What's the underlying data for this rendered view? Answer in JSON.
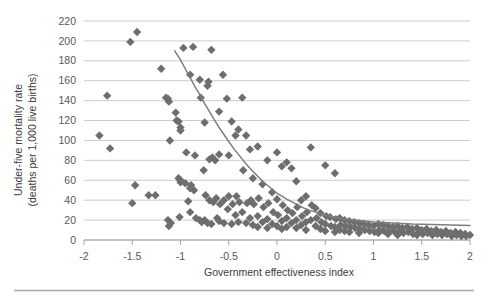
{
  "chart_data": {
    "type": "scatter",
    "title": "",
    "subtitle": "",
    "xlabel": "Government effectiveness index",
    "ylabel": "Under-five mortality rate (deaths per 1,000 live births)",
    "ylabel_line1": "Under-five mortality rate",
    "ylabel_line2": "(deaths per 1,000 live births)",
    "xlim": [
      -2,
      2
    ],
    "ylim": [
      0,
      220
    ],
    "xticks": [
      -2,
      -1.5,
      -1,
      -0.5,
      0,
      0.5,
      1,
      1.5,
      2
    ],
    "xtick_labels": [
      "-2",
      "-1.5",
      "-1",
      "-0.5",
      "0",
      "0.5",
      "1",
      "1.5",
      "2"
    ],
    "yticks": [
      0,
      20,
      40,
      60,
      80,
      100,
      120,
      140,
      160,
      180,
      200,
      220
    ],
    "ytick_labels": [
      "0",
      "20",
      "40",
      "60",
      "80",
      "100",
      "120",
      "140",
      "160",
      "180",
      "200",
      "220"
    ],
    "grid": "horizontal",
    "legend": "none",
    "marker_shape": "diamond",
    "marker_color": "#6d6e70",
    "marker_size": 4.2,
    "trendline": {
      "type": "power-decay",
      "color": "#7d7e80",
      "width": 1.5,
      "points": [
        [
          -1.06,
          190
        ],
        [
          -1.0,
          181
        ],
        [
          -0.95,
          172
        ],
        [
          -0.9,
          163
        ],
        [
          -0.85,
          154
        ],
        [
          -0.8,
          146
        ],
        [
          -0.75,
          137
        ],
        [
          -0.7,
          129
        ],
        [
          -0.65,
          121
        ],
        [
          -0.6,
          113
        ],
        [
          -0.55,
          106
        ],
        [
          -0.5,
          99
        ],
        [
          -0.45,
          92
        ],
        [
          -0.4,
          86
        ],
        [
          -0.35,
          80
        ],
        [
          -0.3,
          74
        ],
        [
          -0.25,
          69
        ],
        [
          -0.2,
          64
        ],
        [
          -0.15,
          59
        ],
        [
          -0.1,
          55
        ],
        [
          -0.05,
          51
        ],
        [
          0.0,
          47
        ],
        [
          0.1,
          41
        ],
        [
          0.2,
          36
        ],
        [
          0.3,
          31
        ],
        [
          0.4,
          28
        ],
        [
          0.5,
          25
        ],
        [
          0.6,
          23
        ],
        [
          0.7,
          21
        ],
        [
          0.8,
          20
        ],
        [
          0.9,
          19
        ],
        [
          1.0,
          18
        ],
        [
          1.2,
          17
        ],
        [
          1.4,
          16
        ],
        [
          1.6,
          15.5
        ],
        [
          1.8,
          15
        ],
        [
          2.0,
          14.5
        ]
      ]
    },
    "points": [
      [
        -1.84,
        105
      ],
      [
        -1.76,
        145
      ],
      [
        -1.73,
        92
      ],
      [
        -1.52,
        199
      ],
      [
        -1.45,
        209
      ],
      [
        -1.47,
        55
      ],
      [
        -1.5,
        37
      ],
      [
        -1.33,
        45
      ],
      [
        -1.26,
        45
      ],
      [
        -1.2,
        172
      ],
      [
        -1.15,
        143
      ],
      [
        -1.13,
        142
      ],
      [
        -1.12,
        139
      ],
      [
        -1.11,
        100
      ],
      [
        -1.13,
        20
      ],
      [
        -1.12,
        14
      ],
      [
        -1.1,
        17
      ],
      [
        -1.05,
        128
      ],
      [
        -1.04,
        120
      ],
      [
        -1.02,
        119
      ],
      [
        -1.0,
        113
      ],
      [
        -1.0,
        110
      ],
      [
        -1.02,
        62
      ],
      [
        -1.0,
        60
      ],
      [
        -1.0,
        58
      ],
      [
        -1.01,
        23
      ],
      [
        -0.97,
        193
      ],
      [
        -0.94,
        88
      ],
      [
        -0.95,
        57
      ],
      [
        -0.9,
        166
      ],
      [
        -0.89,
        55
      ],
      [
        -0.9,
        52
      ],
      [
        -0.92,
        39
      ],
      [
        -0.9,
        28
      ],
      [
        -0.87,
        194
      ],
      [
        -0.85,
        85
      ],
      [
        -0.86,
        50
      ],
      [
        -0.84,
        22
      ],
      [
        -0.8,
        161
      ],
      [
        -0.79,
        143
      ],
      [
        -0.8,
        20
      ],
      [
        -0.78,
        18
      ],
      [
        -0.75,
        118
      ],
      [
        -0.76,
        70
      ],
      [
        -0.74,
        45
      ],
      [
        -0.75,
        20
      ],
      [
        -0.72,
        155
      ],
      [
        -0.71,
        159
      ],
      [
        -0.7,
        81
      ],
      [
        -0.7,
        40
      ],
      [
        -0.72,
        17
      ],
      [
        -0.68,
        191
      ],
      [
        -0.67,
        83
      ],
      [
        -0.66,
        38
      ],
      [
        -0.68,
        16
      ],
      [
        -0.64,
        80
      ],
      [
        -0.63,
        42
      ],
      [
        -0.62,
        22
      ],
      [
        -0.6,
        129
      ],
      [
        -0.6,
        86
      ],
      [
        -0.59,
        36
      ],
      [
        -0.6,
        19
      ],
      [
        -0.56,
        166
      ],
      [
        -0.55,
        40
      ],
      [
        -0.55,
        17
      ],
      [
        -0.52,
        142
      ],
      [
        -0.5,
        85
      ],
      [
        -0.5,
        44
      ],
      [
        -0.51,
        31
      ],
      [
        -0.47,
        119
      ],
      [
        -0.46,
        36
      ],
      [
        -0.47,
        16
      ],
      [
        -0.43,
        105
      ],
      [
        -0.42,
        44
      ],
      [
        -0.43,
        25
      ],
      [
        -0.4,
        111
      ],
      [
        -0.39,
        38
      ],
      [
        -0.4,
        18
      ],
      [
        -0.36,
        143
      ],
      [
        -0.35,
        70
      ],
      [
        -0.36,
        28
      ],
      [
        -0.32,
        105
      ],
      [
        -0.31,
        37
      ],
      [
        -0.32,
        17
      ],
      [
        -0.28,
        91
      ],
      [
        -0.27,
        40
      ],
      [
        -0.28,
        22
      ],
      [
        -0.25,
        62
      ],
      [
        -0.24,
        36
      ],
      [
        -0.25,
        15
      ],
      [
        -0.2,
        94
      ],
      [
        -0.19,
        42
      ],
      [
        -0.2,
        24
      ],
      [
        -0.2,
        13
      ],
      [
        -0.15,
        56
      ],
      [
        -0.14,
        33
      ],
      [
        -0.15,
        18
      ],
      [
        -0.1,
        80
      ],
      [
        -0.09,
        37
      ],
      [
        -0.1,
        21
      ],
      [
        -0.1,
        12
      ],
      [
        -0.05,
        48
      ],
      [
        -0.04,
        28
      ],
      [
        -0.05,
        16
      ],
      [
        0.0,
        88
      ],
      [
        0.0,
        41
      ],
      [
        0.01,
        25
      ],
      [
        0.0,
        14
      ],
      [
        0.05,
        74
      ],
      [
        0.06,
        35
      ],
      [
        0.05,
        19
      ],
      [
        0.05,
        11
      ],
      [
        0.1,
        78
      ],
      [
        0.11,
        30
      ],
      [
        0.1,
        22
      ],
      [
        0.1,
        13
      ],
      [
        0.15,
        72
      ],
      [
        0.16,
        27
      ],
      [
        0.15,
        17
      ],
      [
        0.2,
        59
      ],
      [
        0.21,
        33
      ],
      [
        0.2,
        20
      ],
      [
        0.2,
        12
      ],
      [
        0.25,
        40
      ],
      [
        0.26,
        24
      ],
      [
        0.25,
        15
      ],
      [
        0.3,
        44
      ],
      [
        0.31,
        28
      ],
      [
        0.3,
        18
      ],
      [
        0.3,
        10
      ],
      [
        0.35,
        93
      ],
      [
        0.36,
        35
      ],
      [
        0.35,
        20
      ],
      [
        0.4,
        32
      ],
      [
        0.41,
        22
      ],
      [
        0.4,
        14
      ],
      [
        0.45,
        27
      ],
      [
        0.46,
        18
      ],
      [
        0.45,
        11
      ],
      [
        0.5,
        75
      ],
      [
        0.51,
        24
      ],
      [
        0.5,
        16
      ],
      [
        0.5,
        9
      ],
      [
        0.55,
        23
      ],
      [
        0.56,
        14
      ],
      [
        0.6,
        67
      ],
      [
        0.61,
        21
      ],
      [
        0.6,
        13
      ],
      [
        0.6,
        8
      ],
      [
        0.65,
        22
      ],
      [
        0.66,
        15
      ],
      [
        0.65,
        10
      ],
      [
        0.7,
        20
      ],
      [
        0.71,
        14
      ],
      [
        0.7,
        9
      ],
      [
        0.75,
        19
      ],
      [
        0.76,
        13
      ],
      [
        0.75,
        8
      ],
      [
        0.8,
        18
      ],
      [
        0.81,
        12
      ],
      [
        0.85,
        17
      ],
      [
        0.86,
        11
      ],
      [
        0.85,
        7
      ],
      [
        0.9,
        16
      ],
      [
        0.91,
        10
      ],
      [
        0.95,
        15
      ],
      [
        0.96,
        9
      ],
      [
        1.0,
        14
      ],
      [
        1.01,
        8
      ],
      [
        1.05,
        16
      ],
      [
        1.06,
        10
      ],
      [
        1.05,
        7
      ],
      [
        1.1,
        15
      ],
      [
        1.11,
        9
      ],
      [
        1.15,
        14
      ],
      [
        1.16,
        8
      ],
      [
        1.15,
        6
      ],
      [
        1.2,
        13
      ],
      [
        1.21,
        9
      ],
      [
        1.25,
        14
      ],
      [
        1.26,
        8
      ],
      [
        1.25,
        5
      ],
      [
        1.3,
        12
      ],
      [
        1.31,
        7
      ],
      [
        1.35,
        13
      ],
      [
        1.36,
        8
      ],
      [
        1.4,
        11
      ],
      [
        1.41,
        6
      ],
      [
        1.45,
        12
      ],
      [
        1.46,
        7
      ],
      [
        1.45,
        5
      ],
      [
        1.5,
        10
      ],
      [
        1.51,
        6
      ],
      [
        1.55,
        11
      ],
      [
        1.56,
        7
      ],
      [
        1.6,
        9
      ],
      [
        1.61,
        5
      ],
      [
        1.65,
        10
      ],
      [
        1.66,
        6
      ],
      [
        1.7,
        8
      ],
      [
        1.71,
        5
      ],
      [
        1.75,
        9
      ],
      [
        1.76,
        6
      ],
      [
        1.8,
        7
      ],
      [
        1.81,
        4
      ],
      [
        1.85,
        8
      ],
      [
        1.86,
        5
      ],
      [
        1.9,
        7
      ],
      [
        1.91,
        4
      ],
      [
        1.95,
        6
      ],
      [
        1.96,
        4
      ],
      [
        2.0,
        5
      ]
    ]
  }
}
